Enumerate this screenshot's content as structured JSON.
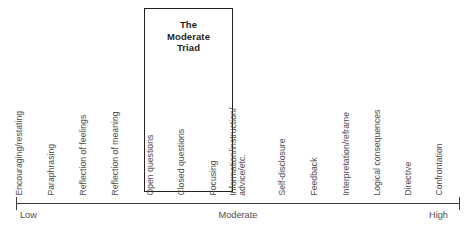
{
  "diagram": {
    "title_box": {
      "line1": "The",
      "line2": "Moderate",
      "line3": "Triad"
    },
    "techniques": [
      {
        "label": "Encouraging/restating",
        "x": 25,
        "in_triad": false
      },
      {
        "label": "Paraphrasing",
        "x": 57,
        "in_triad": false
      },
      {
        "label": "Reflection of feelings",
        "x": 89,
        "in_triad": false
      },
      {
        "label": "Reflection of meaning",
        "x": 121,
        "in_triad": false
      },
      {
        "label": "Open questions",
        "x": 156,
        "in_triad": true
      },
      {
        "label": "Closed questions",
        "x": 187,
        "in_triad": true
      },
      {
        "label": "Focusing",
        "x": 219,
        "in_triad": true
      },
      {
        "label": "Information/instruction/",
        "label2": "advice/etc.",
        "x": 248,
        "in_triad": false
      },
      {
        "label": "Self-disclosure",
        "x": 288,
        "in_triad": false
      },
      {
        "label": "Feedback",
        "x": 320,
        "in_triad": false
      },
      {
        "label": "Interpretation/reframe",
        "x": 352,
        "in_triad": false
      },
      {
        "label": "Logical consequences",
        "x": 383,
        "in_triad": false
      },
      {
        "label": "Directive",
        "x": 414,
        "in_triad": false
      },
      {
        "label": "Confrontation",
        "x": 445,
        "in_triad": false
      }
    ],
    "axis": {
      "low_label": "Low",
      "moderate_label": "Moderate",
      "high_label": "High"
    },
    "colors": {
      "text": "#4c4c4c",
      "box_border": "#231f20",
      "axis": "#3b3b3b",
      "background": "#ffffff"
    }
  }
}
